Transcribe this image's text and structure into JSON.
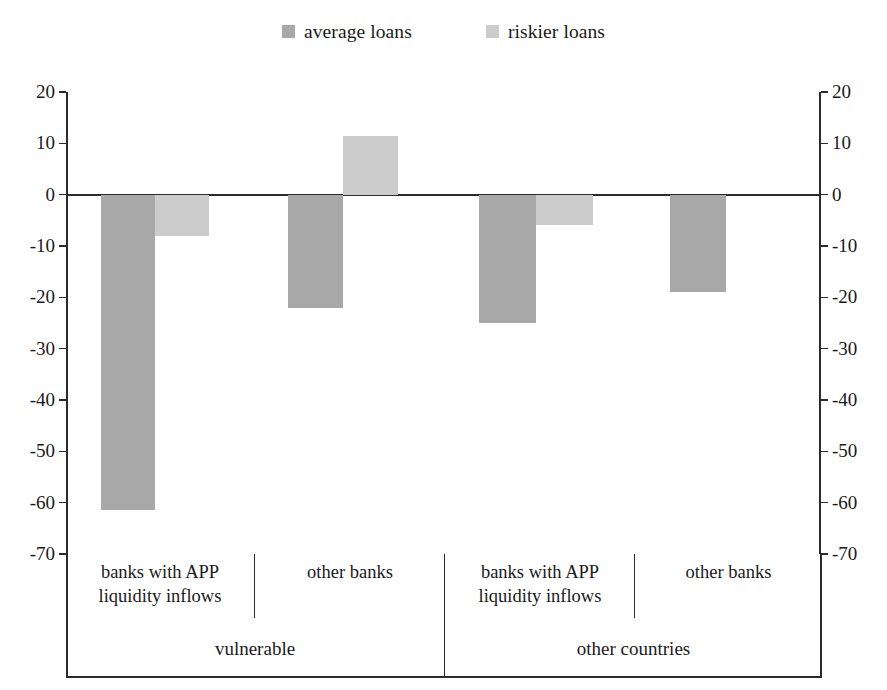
{
  "legend": {
    "items": [
      {
        "label": "average loans",
        "color": "#a8a8a8",
        "icon": "square-swatch-icon"
      },
      {
        "label": "riskier loans",
        "color": "#cccccc",
        "icon": "square-swatch-icon"
      }
    ]
  },
  "axis": {
    "ticks": [
      "20",
      "10",
      "0",
      "-10",
      "-20",
      "-30",
      "-40",
      "-50",
      "-60",
      "-70"
    ]
  },
  "categories": {
    "sub": [
      "banks with APP liquidity inflows",
      "other banks",
      "banks with APP liquidity inflows",
      "other banks"
    ],
    "sub_lines": [
      [
        "banks with APP",
        "liquidity inflows"
      ],
      [
        "other banks",
        ""
      ],
      [
        "banks with APP",
        "liquidity inflows"
      ],
      [
        "other banks",
        ""
      ]
    ],
    "groups": [
      "vulnerable",
      "other countries"
    ]
  },
  "chart_data": {
    "type": "bar",
    "title": "",
    "xlabel": "",
    "ylabel": "",
    "ylim": [
      -70,
      20
    ],
    "grid": false,
    "legend_position": "top-center",
    "categories": [
      "vulnerable / banks with APP liquidity inflows",
      "vulnerable / other banks",
      "other countries / banks with APP liquidity inflows",
      "other countries / other banks"
    ],
    "series": [
      {
        "name": "average loans",
        "color": "#a8a8a8",
        "values": [
          -61.5,
          -22.0,
          -25.0,
          -19.0
        ]
      },
      {
        "name": "riskier loans",
        "color": "#cccccc",
        "values": [
          -8.0,
          11.5,
          -6.0,
          null
        ]
      }
    ],
    "axis_ticks": [
      20,
      10,
      0,
      -10,
      -20,
      -30,
      -40,
      -50,
      -60,
      -70
    ]
  }
}
